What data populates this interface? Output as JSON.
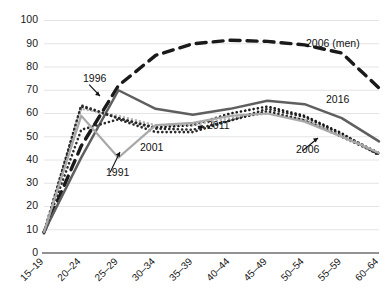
{
  "chart_data": {
    "type": "line",
    "title": "",
    "subtitle": "",
    "xlabel": "",
    "ylabel": "",
    "ylim": [
      0,
      100
    ],
    "yticks": [
      0,
      10,
      20,
      30,
      40,
      50,
      60,
      70,
      80,
      90,
      100
    ],
    "grid": true,
    "legend_position": "inline-annotations",
    "categories": [
      "15–19",
      "20–24",
      "25–29",
      "30–34",
      "35–39",
      "40–44",
      "45–49",
      "50–54",
      "55–59",
      "60–64"
    ],
    "series": [
      {
        "name": "2006 (men)",
        "style": "long-dash",
        "color": "#1a1a1a",
        "width": 3.4,
        "values": [
          9,
          46,
          72,
          85,
          90,
          91.5,
          91,
          89.5,
          86,
          71
        ]
      },
      {
        "name": "2016",
        "style": "solid",
        "color": "#5f5f5f",
        "width": 2.5,
        "values": [
          9,
          41,
          70,
          62,
          59.5,
          62,
          65.5,
          64,
          58,
          48
        ]
      },
      {
        "name": "2011",
        "style": "dotted",
        "color": "#2a2a2a",
        "width": 2.6,
        "values": [
          9,
          53,
          57.5,
          52,
          52,
          57,
          62,
          58.5,
          51,
          43
        ]
      },
      {
        "name": "2006",
        "style": "dotted",
        "color": "#1a1a1a",
        "width": 2.6,
        "values": [
          8.5,
          63,
          58,
          54,
          55,
          60,
          63,
          59,
          51.5,
          42
        ]
      },
      {
        "name": "2001",
        "style": "dotted-light",
        "color": "#b4b4b4",
        "width": 2.4,
        "values": [
          9,
          62,
          59,
          55,
          55,
          58,
          60,
          57.5,
          50.5,
          43
        ]
      },
      {
        "name": "1996",
        "style": "dotted",
        "color": "#2a2a2a",
        "width": 2.6,
        "values": [
          9,
          63.5,
          58,
          53.5,
          53,
          57,
          61,
          57,
          50,
          42.5
        ]
      },
      {
        "name": "1991",
        "style": "solid-light",
        "color": "#a9a9a9",
        "width": 2.2,
        "values": [
          9,
          59,
          41,
          55,
          56,
          59,
          60,
          56.5,
          50,
          43
        ]
      }
    ],
    "annotations": [
      {
        "label": "1996",
        "x": 83,
        "y": 82,
        "ax": 100,
        "ay": 96,
        "anchor": "start"
      },
      {
        "label": "1991",
        "x": 106,
        "y": 176,
        "ax": 120,
        "ay": 152,
        "anchor": "start"
      },
      {
        "label": "2001",
        "x": 140,
        "y": 151,
        "ax": null,
        "ay": null,
        "anchor": "start"
      },
      {
        "label": "2011",
        "x": 207,
        "y": 129,
        "ax": 198,
        "ay": 126,
        "anchor": "start"
      },
      {
        "label": "2006",
        "x": 296,
        "y": 153,
        "ax": 318,
        "ay": 138,
        "anchor": "start"
      },
      {
        "label": "2016",
        "x": 326,
        "y": 103,
        "ax": null,
        "ay": null,
        "anchor": "start"
      },
      {
        "label": "2006 (men)",
        "x": 306,
        "y": 47,
        "ax": null,
        "ay": null,
        "anchor": "start"
      }
    ]
  }
}
